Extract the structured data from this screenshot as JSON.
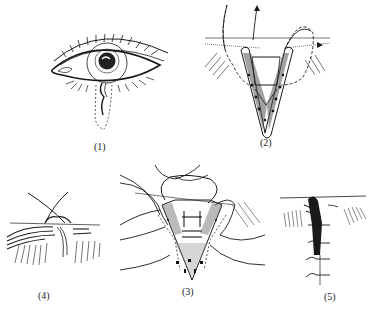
{
  "figure": {
    "panels": [
      {
        "id": "1",
        "label": "(1)",
        "content": "Eye with lashes; dashed V-shaped excision outline below lower lid margin with wavy lesion"
      },
      {
        "id": "2",
        "label": "(2)",
        "content": "V-shaped full-thickness wedge with stippled tarsus; sutures passing through lid margin with arrows"
      },
      {
        "id": "3",
        "label": "(3)",
        "content": "Wedge closure with tarsal sutures placed, multiple suture threads, stippled tissue"
      },
      {
        "id": "4",
        "label": "(4)",
        "content": "Lid margin suture tied, crossing threads above lash line"
      },
      {
        "id": "5",
        "label": "(5)",
        "content": "Completed closure with interrupted skin sutures along vertical wound line"
      }
    ]
  },
  "colors": {
    "ink": "#1a1a1a",
    "background": "#ffffff"
  }
}
